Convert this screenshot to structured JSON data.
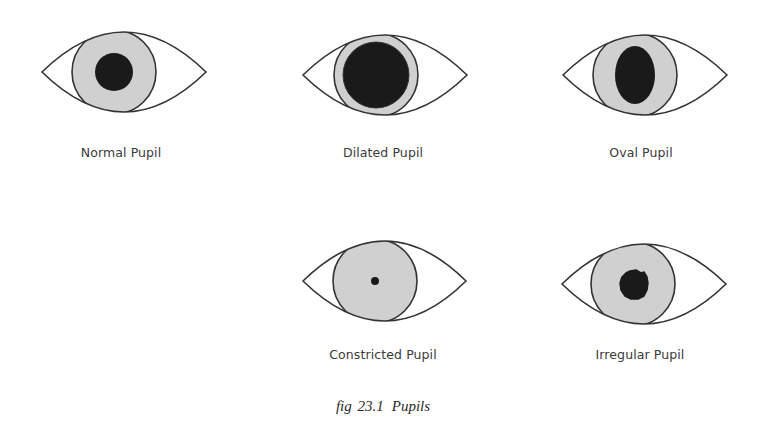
{
  "figure": {
    "caption_number": "fig 23.1",
    "caption_title": "Pupils"
  },
  "colors": {
    "outline": "#333333",
    "iris": "#d0d0d0",
    "pupil": "#1a1a1a",
    "sclera": "#ffffff"
  },
  "eyes": [
    {
      "label": "Normal Pupil",
      "pupil_shape": "circle",
      "pupil_size": "medium"
    },
    {
      "label": "Dilated Pupil",
      "pupil_shape": "circle",
      "pupil_size": "large"
    },
    {
      "label": "Oval Pupil",
      "pupil_shape": "oval",
      "pupil_size": "medium"
    },
    {
      "label": "Constricted Pupil",
      "pupil_shape": "circle",
      "pupil_size": "pinpoint"
    },
    {
      "label": "Irregular Pupil",
      "pupil_shape": "irregular",
      "pupil_size": "medium"
    }
  ]
}
